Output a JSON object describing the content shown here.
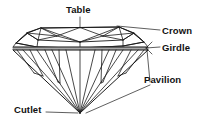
{
  "diagram": {
    "view": "profile",
    "background_color": "#ffffff",
    "line_color": "#1a1a1a",
    "girdle_color": "#9a9a9a",
    "text_color": "#111111",
    "labels": {
      "table": "Table",
      "crown": "Crown",
      "girdle": "Girdle",
      "pavilion": "Pavilion",
      "cutlet": "Cutlet"
    },
    "parts": [
      {
        "name": "Table",
        "description": "Flat facet on the very top of the stone",
        "leader_from": [
          80,
          17
        ],
        "leader_to": [
          80,
          28
        ]
      },
      {
        "name": "Crown",
        "description": "Upper section between the table and the girdle",
        "leader_from": [
          160,
          29
        ],
        "leader_to": [
          117,
          26
        ]
      },
      {
        "name": "Girdle",
        "description": "Widest band around the middle of the stone",
        "leader_from": [
          160,
          47
        ],
        "leader_to": [
          146,
          48
        ]
      },
      {
        "name": "Pavilion",
        "description": "Lower section sloping down from the girdle to the culet",
        "leader_from": [
          150,
          85
        ],
        "leader_to": [
          86,
          112
        ]
      },
      {
        "name": "Cutlet",
        "description": "Point or tiny facet at the bottom tip of the stone",
        "leader_from": [
          46,
          112
        ],
        "leader_to": [
          80,
          113
        ]
      }
    ]
  }
}
